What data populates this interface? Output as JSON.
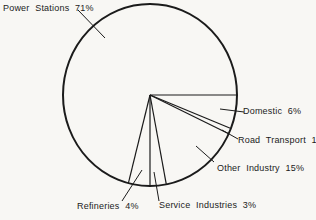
{
  "colors": {
    "ink": "#1b1b1b",
    "paper": "#f8f7f4"
  },
  "chart_data": {
    "type": "pie",
    "categories": [
      "Domestic",
      "Road Transport",
      "Other Industry",
      "Service Industries",
      "Refineries",
      "Power Stations"
    ],
    "values": [
      6,
      1,
      15,
      3,
      4,
      71
    ],
    "unit": "%",
    "start_angle_deg": 0,
    "direction": "clockwise",
    "legend": "none",
    "style": {
      "fill": "none",
      "outline_only": true,
      "labels_outside_with_leader_lines": true
    }
  },
  "labels": {
    "power_stations": "Power Stations 71%",
    "domestic": "Domestic 6%",
    "road_transport": "Road Transport 1%",
    "other_industry": "Other Industry 15%",
    "refineries": "Refineries 4%",
    "service_industries": "Service Industries 3%"
  }
}
